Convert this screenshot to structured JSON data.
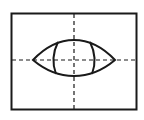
{
  "diagram": {
    "type": "technical-drawing",
    "colors": {
      "background": "#ffffff",
      "stroke": "#1a1a1a"
    },
    "frame": {
      "x": 11,
      "y": 13,
      "width": 126,
      "height": 97
    },
    "center_lines": {
      "horizontal": {
        "y": 60,
        "x1": 11,
        "x2": 137,
        "style": "dashed"
      },
      "vertical": {
        "x": 74,
        "y1": 13,
        "y2": 110,
        "style": "dashed"
      }
    },
    "eye_outline": {
      "left_tip_x": 33,
      "right_tip_x": 115,
      "center_y": 60,
      "top_y": 40,
      "bottom_y": 76
    },
    "inner_shape": {
      "left_x": 52,
      "right_x": 96,
      "top_y": 40,
      "bottom_y": 76
    }
  }
}
